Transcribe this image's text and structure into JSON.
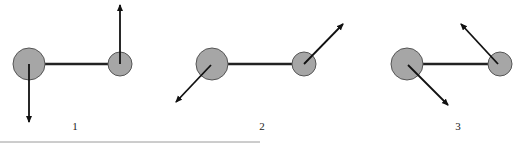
{
  "figure": {
    "colors": {
      "atom_fill": "#a6a6a6",
      "atom_stroke": "#555555",
      "bond": "#222222",
      "arrow": "#111111",
      "rule": "#9a9a9a"
    },
    "panels": [
      {
        "label": "1",
        "big_atom": {
          "cx": 29,
          "cy": 64,
          "r": 16
        },
        "small_atom": {
          "cx": 120,
          "cy": 64,
          "r": 12
        },
        "big_arrow": {
          "x1": 29,
          "y1": 64,
          "x2": 29,
          "y2": 122
        },
        "small_arrow": {
          "x1": 120,
          "y1": 64,
          "x2": 120,
          "y2": 5
        },
        "label_x": 75
      },
      {
        "label": "2",
        "big_atom": {
          "cx": 212,
          "cy": 64,
          "r": 16
        },
        "small_atom": {
          "cx": 304,
          "cy": 64,
          "r": 12
        },
        "big_arrow": {
          "x1": 211,
          "y1": 65,
          "x2": 176,
          "y2": 102
        },
        "small_arrow": {
          "x1": 304,
          "y1": 64,
          "x2": 343,
          "y2": 24
        },
        "label_x": 262
      },
      {
        "label": "3",
        "big_atom": {
          "cx": 407,
          "cy": 64,
          "r": 16
        },
        "small_atom": {
          "cx": 500,
          "cy": 64,
          "r": 12
        },
        "big_arrow": {
          "x1": 408,
          "y1": 65,
          "x2": 448,
          "y2": 105
        },
        "small_arrow": {
          "x1": 498,
          "y1": 64,
          "x2": 461,
          "y2": 24
        },
        "label_x": 458
      }
    ]
  }
}
